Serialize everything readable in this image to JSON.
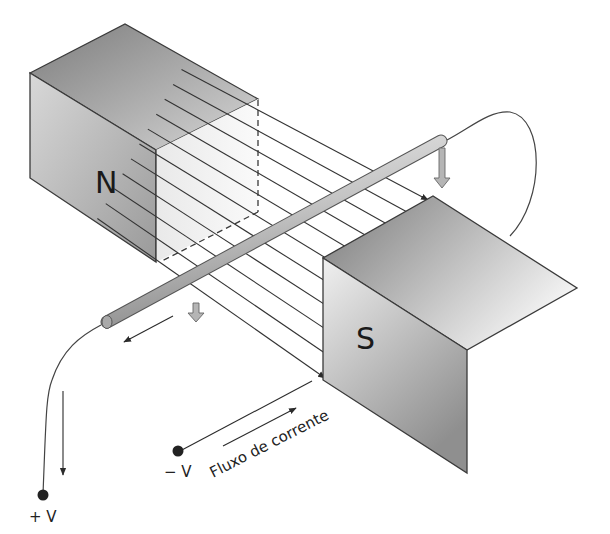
{
  "diagram": {
    "magnets": {
      "north_label": "N",
      "south_label": "S"
    },
    "field_lines": {
      "count": 11,
      "direction": "N to S"
    },
    "terminals": {
      "positive_label": "+ V",
      "negative_label": "− V"
    },
    "current_flow_label": "Fluxo de corrente",
    "colors": {
      "background": "#ffffff",
      "line": "#2b2b2b",
      "magnet_dark": "#8a8a8a",
      "magnet_light": "#f2f2f2",
      "rod": "#c9c9c9",
      "force_arrow": "#a8a8a8"
    }
  }
}
